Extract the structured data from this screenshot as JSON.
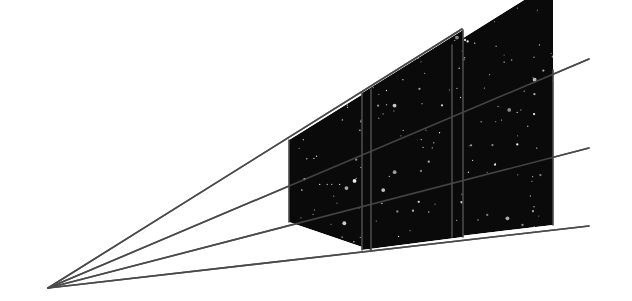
{
  "figure": {
    "canvas": {
      "width": 632,
      "height": 301
    },
    "background_color": "#ffffff",
    "panel_fill_color": "#0a0a0a",
    "star_color": "#ffffff",
    "line_color": "#4a4a4a",
    "line_width": 1.6,
    "vanishing_point": {
      "x": 48,
      "y": 288
    },
    "rays": [
      {
        "name": "ray-top",
        "x1": 48,
        "y1": 288,
        "x2": 462,
        "y2": 29
      },
      {
        "name": "ray-upper-middle",
        "x1": 48,
        "y1": 288,
        "x2": 589,
        "y2": 59
      },
      {
        "name": "ray-lower-middle",
        "x1": 48,
        "y1": 288,
        "x2": 589,
        "y2": 148
      },
      {
        "name": "ray-bottom",
        "x1": 48,
        "y1": 288,
        "x2": 589,
        "y2": 226
      }
    ],
    "panels": [
      {
        "name": "panel-near-left",
        "points": "289,140 371,89 371,250 289,222",
        "left_x": 289,
        "right_x": 371,
        "top_left_y": 140,
        "bottom_left_y": 222,
        "top_right_y": 89,
        "bottom_right_y": 250,
        "star_count": 46,
        "star_seed": 11
      },
      {
        "name": "panel-middle",
        "points": "362,93 463,30 463,237 362,250",
        "left_x": 362,
        "right_x": 463,
        "top_left_y": 93,
        "bottom_left_y": 250,
        "top_right_y": 30,
        "bottom_right_y": 237,
        "star_count": 62,
        "star_seed": 27
      },
      {
        "name": "panel-far-right",
        "points": "452,45 553,-18 553,225 452,237",
        "left_x": 452,
        "right_x": 553,
        "top_left_y": 45,
        "bottom_left_y": 237,
        "top_right_y": 70,
        "bottom_right_y": 225,
        "star_count": 78,
        "star_seed": 43
      }
    ],
    "panel_edges": [
      {
        "name": "edge-left-panel-left",
        "x1": 289,
        "y1": 140,
        "x2": 289,
        "y2": 222
      },
      {
        "name": "edge-left-panel-right",
        "x1": 371,
        "y1": 89,
        "x2": 371,
        "y2": 250
      },
      {
        "name": "edge-mid-panel-left",
        "x1": 362,
        "y1": 93,
        "x2": 362,
        "y2": 250
      },
      {
        "name": "edge-mid-panel-right",
        "x1": 463,
        "y1": 30,
        "x2": 463,
        "y2": 237
      },
      {
        "name": "edge-right-panel-left",
        "x1": 452,
        "y1": 45,
        "x2": 452,
        "y2": 237
      },
      {
        "name": "edge-right-panel-right",
        "x1": 553,
        "y1": 70,
        "x2": 553,
        "y2": 225
      }
    ]
  }
}
